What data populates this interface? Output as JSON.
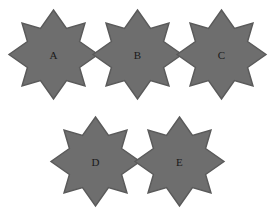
{
  "figure": {
    "background_color": "#ffffff",
    "width": 277,
    "height": 214,
    "shape_type": "eight-pointed-star",
    "shape_description": "octagram formed by two overlapping squares rotated 45 degrees",
    "fill_color": "#6e6e6e",
    "stroke_color": "#5a5a5a",
    "label_color": "#1a1a1a",
    "rows": [
      {
        "row_index": 0,
        "count": 3,
        "labels": [
          "A",
          "B",
          "C"
        ]
      },
      {
        "row_index": 1,
        "count": 2,
        "labels": [
          "D",
          "E"
        ]
      }
    ],
    "shapes": [
      {
        "label": "A",
        "row": 0,
        "column": 0,
        "x": 9,
        "y": 10,
        "size": 89,
        "points": 8
      },
      {
        "label": "B",
        "row": 0,
        "column": 1,
        "x": 93,
        "y": 10,
        "size": 89,
        "points": 8
      },
      {
        "label": "C",
        "row": 0,
        "column": 2,
        "x": 177,
        "y": 10,
        "size": 89,
        "points": 8
      },
      {
        "label": "D",
        "row": 1,
        "column": 0,
        "x": 51,
        "y": 117,
        "size": 89,
        "points": 8
      },
      {
        "label": "E",
        "row": 1,
        "column": 1,
        "x": 135,
        "y": 117,
        "size": 89,
        "points": 8
      }
    ]
  }
}
